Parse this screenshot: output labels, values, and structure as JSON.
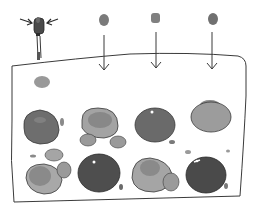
{
  "illustration": {
    "description": "Hand-drawn sketch: a dropper squeezed over a tray; three drops fall into the tray which contains eight colored blobs in a 4x2 grid plus small satellite droplets",
    "colors": {
      "ink": "#3a3a3a",
      "dark_blob": "#4a4a4a",
      "mid_blob": "#7a7a7a",
      "light_blob": "#9a9a9a",
      "pale_blob": "#b5b5b5",
      "background": "#ffffff"
    },
    "dropper": {
      "icon": "dropper-icon",
      "squeeze_arrows": 2
    },
    "falling_drops": [
      {
        "x": 104,
        "y": 20,
        "arrow_to_y": 70
      },
      {
        "x": 156,
        "y": 18,
        "arrow_to_y": 68
      },
      {
        "x": 213,
        "y": 19,
        "arrow_to_y": 69
      }
    ],
    "tray": {
      "shape": "rounded-rectangle",
      "rows": 2,
      "columns": 4
    },
    "blobs": [
      {
        "row": 1,
        "col": 1,
        "cx": 41,
        "cy": 127,
        "tone": "mid"
      },
      {
        "row": 1,
        "col": 2,
        "cx": 101,
        "cy": 125,
        "tone": "light"
      },
      {
        "row": 1,
        "col": 3,
        "cx": 155,
        "cy": 125,
        "tone": "mid"
      },
      {
        "row": 1,
        "col": 4,
        "cx": 211,
        "cy": 115,
        "tone": "light"
      },
      {
        "row": 2,
        "col": 1,
        "cx": 43,
        "cy": 177,
        "tone": "light"
      },
      {
        "row": 2,
        "col": 2,
        "cx": 99,
        "cy": 173,
        "tone": "dark"
      },
      {
        "row": 2,
        "col": 3,
        "cx": 153,
        "cy": 174,
        "tone": "light"
      },
      {
        "row": 2,
        "col": 4,
        "cx": 207,
        "cy": 174,
        "tone": "dark"
      }
    ]
  }
}
